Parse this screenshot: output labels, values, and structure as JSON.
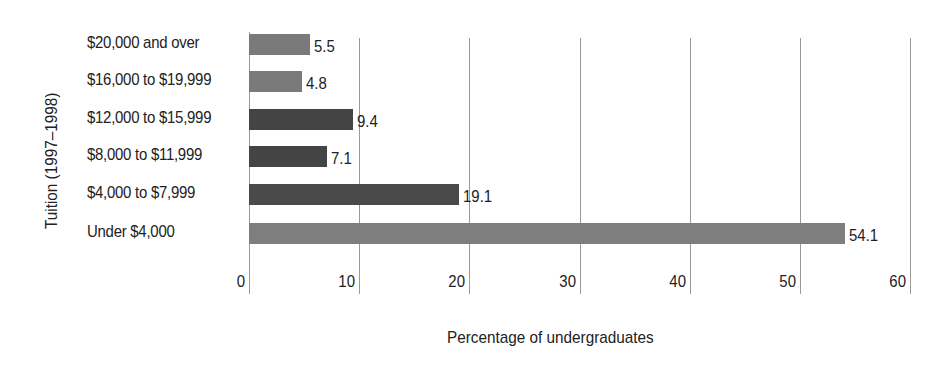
{
  "chart_data": {
    "type": "bar",
    "orientation": "horizontal",
    "title": "",
    "xlabel": "Percentage of undergraduates",
    "ylabel": "Tuition (1997–1998)",
    "categories": [
      "$20,000 and over",
      "$16,000 to $19,999",
      "$12,000 to $15,999",
      "$8,000 to $11,999",
      "$4,000 to $7,999",
      "Under $4,000"
    ],
    "values": [
      5.5,
      4.8,
      9.4,
      7.1,
      19.1,
      54.1
    ],
    "value_labels": [
      "5.5",
      "4.8",
      "9.4",
      "7.1",
      "19.1",
      "54.1"
    ],
    "bar_colors": [
      "#7a7a7a",
      "#7a7a7a",
      "#444444",
      "#444444",
      "#4a4a4a",
      "#7e7e7e"
    ],
    "xlim": [
      0,
      60
    ],
    "xticks": [
      "0",
      "10",
      "20",
      "30",
      "40",
      "50",
      "60"
    ],
    "grid": "vertical",
    "legend": null
  }
}
